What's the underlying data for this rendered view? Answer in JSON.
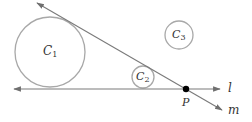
{
  "diagram": {
    "colors": {
      "line": "#7a7a7a",
      "circle": "#a0a0a0",
      "point": "#000000",
      "text": "#333333"
    },
    "circles": [
      {
        "id": "C1",
        "letter": "C",
        "sub": "1",
        "cx": 50,
        "cy": 52,
        "r": 35
      },
      {
        "id": "C2",
        "letter": "C",
        "sub": "2",
        "cx": 143,
        "cy": 77,
        "r": 11
      },
      {
        "id": "C3",
        "letter": "C",
        "sub": "3",
        "cx": 179,
        "cy": 35,
        "r": 14
      }
    ],
    "lines": [
      {
        "id": "l",
        "label": "l",
        "x1": 14,
        "y1": 89,
        "x2": 220,
        "y2": 89
      },
      {
        "id": "m",
        "label": "m",
        "x1": 37,
        "y1": 3,
        "x2": 222,
        "y2": 110
      }
    ],
    "point": {
      "label": "P",
      "x": 186,
      "y": 89
    }
  }
}
